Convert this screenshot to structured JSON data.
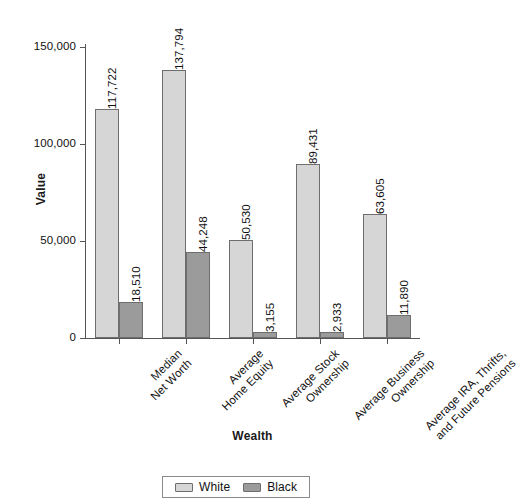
{
  "chart_data": {
    "type": "bar",
    "title": "",
    "subtitle": "",
    "xlabel": "Wealth",
    "ylabel": "Value",
    "categories": [
      "Median\nNet Worth",
      "Average\nHome Equity",
      "Average Stock\nOwnership",
      "Average Business\nOwnership",
      "Average IRA, Thrifts,\nand Future Pensions"
    ],
    "category_lines": [
      [
        "Median",
        "Net Worth"
      ],
      [
        "Average",
        "Home Equity"
      ],
      [
        "Average Stock",
        "Ownership"
      ],
      [
        "Average Business",
        "Ownership"
      ],
      [
        "Average IRA, Thrifts,",
        "and Future Pensions"
      ]
    ],
    "series": [
      {
        "name": "White",
        "color": "#d6d6d6",
        "values": [
          117722,
          137794,
          50530,
          89431,
          63605
        ],
        "labels": [
          "117,722",
          "137,794",
          "50,530",
          "89,431",
          "63,605"
        ]
      },
      {
        "name": "Black",
        "color": "#9b9b9b",
        "values": [
          18510,
          44248,
          3155,
          2933,
          11890
        ],
        "labels": [
          "18,510",
          "44,248",
          "3,155",
          "2,933",
          "11,890"
        ]
      }
    ],
    "ylim": [
      0,
      150000
    ],
    "yticks": [
      0,
      50000,
      100000,
      150000
    ],
    "ytick_labels": [
      "0",
      "50,000",
      "100,000",
      "150,000"
    ],
    "grid": false,
    "legend_position": "bottom",
    "legend_entries": [
      "White",
      "Black"
    ]
  }
}
